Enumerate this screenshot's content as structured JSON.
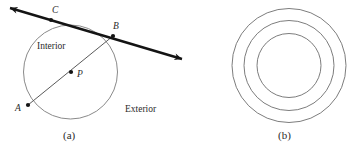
{
  "figure": {
    "panels": [
      {
        "id": "a",
        "caption": "(a)",
        "caption_x": 63,
        "caption_y": 130,
        "circle": {
          "cx": 70.5,
          "cy": 72,
          "r": 47
        },
        "points": [
          {
            "label": "A",
            "x": 28,
            "y": 105,
            "label_x": 15,
            "label_y": 104
          },
          {
            "label": "B",
            "x": 113,
            "y": 36,
            "label_x": 113,
            "label_y": 22
          },
          {
            "label": "C",
            "x": 51,
            "y": 20,
            "label_x": 52,
            "label_y": 6
          },
          {
            "label": "P",
            "x": 71,
            "y": 72,
            "label_x": 77,
            "label_y": 70
          }
        ],
        "chord": {
          "x1": 28,
          "y1": 105,
          "x2": 113,
          "y2": 36
        },
        "secant": {
          "x1": 10,
          "y1": 8,
          "x2": 182,
          "y2": 59,
          "arrows": "both"
        },
        "regions": [
          {
            "label": "Interior",
            "x": 37,
            "y": 42
          },
          {
            "label": "Exterior",
            "x": 125,
            "y": 105
          }
        ]
      },
      {
        "id": "b",
        "caption": "(b)",
        "caption_x": 278,
        "caption_y": 130,
        "circles": [
          {
            "cx": 289,
            "cy": 65.5,
            "r": 57
          },
          {
            "cx": 289,
            "cy": 65.5,
            "r": 45
          },
          {
            "cx": 289,
            "cy": 65.5,
            "r": 32
          }
        ]
      }
    ]
  },
  "colors": {
    "background": "#ffffff",
    "circle_stroke": "#8a8a8a",
    "chord_stroke": "#5a5a5a",
    "secant_stroke": "#141414",
    "label_text": "#2b2b2b"
  }
}
